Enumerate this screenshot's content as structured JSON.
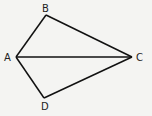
{
  "diagram": {
    "type": "geometry",
    "shape": "kite quadrilateral ABCD with diagonal AC",
    "background": "#f4f4f2",
    "stroke_color": "#111111",
    "points": {
      "A": {
        "label": "A",
        "x": 16,
        "y": 57
      },
      "B": {
        "label": "B",
        "x": 46,
        "y": 15
      },
      "C": {
        "label": "C",
        "x": 132,
        "y": 57
      },
      "D": {
        "label": "D",
        "x": 44,
        "y": 98
      }
    },
    "segments": [
      "AB",
      "BC",
      "CD",
      "DA",
      "AC"
    ]
  }
}
